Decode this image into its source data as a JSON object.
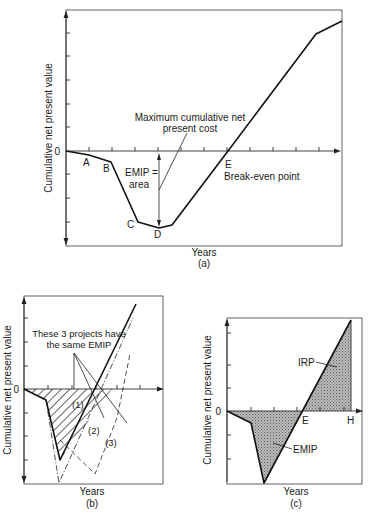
{
  "panels": {
    "a": {
      "caption": "(a)",
      "ylabel": "Cumulative net present value",
      "xlabel": "Years",
      "zero_label": "0",
      "points": {
        "A": "A",
        "B": "B",
        "C": "C",
        "D": "D",
        "E": "E"
      },
      "annotation_max_cost_line1": "Maximum cumulative net",
      "annotation_max_cost_line2": "present cost",
      "annotation_emip_line1": "EMIP =",
      "annotation_emip_line2": "area",
      "annotation_breakeven": "Break-even point"
    },
    "b": {
      "caption": "(b)",
      "ylabel": "Cumulative net present value",
      "xlabel": "Years",
      "zero_label": "0",
      "annotation_line1": "These 3 projects have",
      "annotation_line2": "the same EMIP",
      "project_labels": [
        "(1)",
        "(2)",
        "(3)"
      ]
    },
    "c": {
      "caption": "(c)",
      "ylabel": "Cumulative net present value",
      "xlabel": "Years",
      "zero_label": "0",
      "label_irp": "IRP",
      "label_emip": "EMIP",
      "label_e": "E",
      "label_h": "H"
    }
  }
}
